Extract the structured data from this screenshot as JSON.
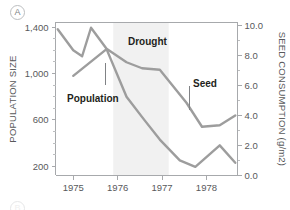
{
  "panel": {
    "letter": "A",
    "next_letter": "B"
  },
  "chart_data": {
    "type": "line",
    "title": "",
    "xlabel": "",
    "ylabel": "POPULATION SIZE",
    "y2label": "SEED CONSUMPTION (g/m2)",
    "xlim": [
      1974.6,
      1978.7
    ],
    "ylim": [
      120,
      1440
    ],
    "y2lim": [
      0.0,
      10.2
    ],
    "grid": false,
    "legend": "inline-annotations",
    "x_ticks": [
      "1975",
      "1976",
      "1977",
      "1978"
    ],
    "x_tick_values": [
      1975,
      1976,
      1977,
      1978
    ],
    "y_ticks": [
      "1,400",
      "1,000",
      "600",
      "200"
    ],
    "y_tick_values": [
      1400,
      1000,
      600,
      200
    ],
    "y2_ticks": [
      "10.0",
      "8.0",
      "6.0",
      "4.0",
      "2.0",
      "0.0"
    ],
    "y2_tick_values": [
      10.0,
      8.0,
      6.0,
      4.0,
      2.0,
      0.0
    ],
    "series": [
      {
        "name": "Seed",
        "axis": "right",
        "units": "g/m2",
        "color": "#9d9d9d",
        "x": [
          1974.65,
          1975.0,
          1975.2,
          1975.4,
          1975.75,
          1976.2,
          1976.55,
          1976.95,
          1977.55,
          1977.9,
          1978.3,
          1978.65
        ],
        "values": [
          9.75,
          8.35,
          7.95,
          9.85,
          8.45,
          7.55,
          7.15,
          7.05,
          4.85,
          3.25,
          3.35,
          4.0
        ]
      },
      {
        "name": "Population",
        "axis": "left",
        "units": "individuals",
        "color": "#9d9d9d",
        "x": [
          1975.0,
          1975.75,
          1976.2,
          1976.6,
          1976.95,
          1977.4,
          1977.75,
          1978.3,
          1978.65
        ],
        "values": [
          980,
          1210,
          800,
          600,
          430,
          250,
          195,
          380,
          230
        ]
      }
    ],
    "annotations": [
      {
        "text": "Drought",
        "kind": "region-label",
        "x": 1976.55,
        "y2": 9.1
      },
      {
        "text": "Population",
        "kind": "series-label",
        "x": 1975.35,
        "y": 700
      },
      {
        "text": "Seed",
        "kind": "series-label",
        "x": 1977.45,
        "y2": 5.9
      }
    ],
    "shaded_regions": [
      {
        "label": "Drought",
        "x_start": 1975.9,
        "x_end": 1977.15,
        "color": "#f1f1f1"
      }
    ]
  }
}
